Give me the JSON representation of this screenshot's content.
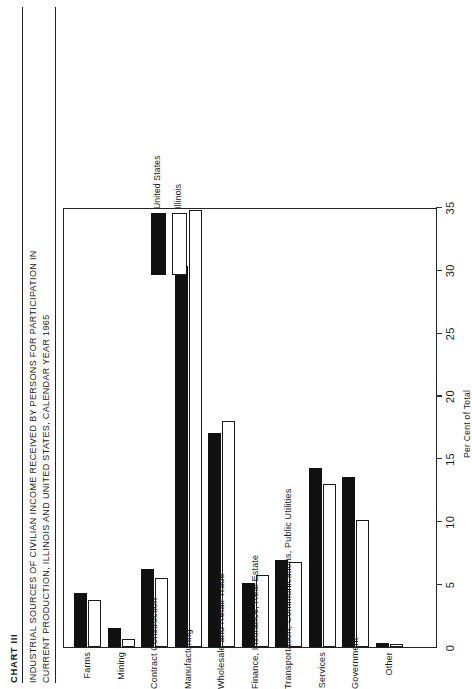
{
  "header": {
    "chart_number": "CHART III",
    "caption_line_1": "INDUSTRIAL SOURCES OF CIVILIAN INCOME RECEIVED BY PERSONS FOR PARTICIPATION IN",
    "caption_line_2": "CURRENT PRODUCTION, ILLINOIS AND UNITED STATES, CALENDAR YEAR 1965"
  },
  "legend": {
    "position": "upper-right-inside-plot",
    "entries": [
      {
        "label": "United States",
        "color": "#111111",
        "style": "solid-black"
      },
      {
        "label": "Illinois",
        "color": "#ffffff",
        "style": "open-outline"
      }
    ]
  },
  "chart_data": {
    "type": "bar",
    "orientation": "vertical-printed-sideways",
    "title": "INDUSTRIAL SOURCES OF CIVILIAN INCOME RECEIVED BY PERSONS FOR PARTICIPATION IN CURRENT PRODUCTION, ILLINOIS AND UNITED STATES, CALENDAR YEAR 1965",
    "xlabel": "",
    "ylabel": "Per Cent of Total",
    "ylim": [
      0,
      35
    ],
    "yticks": [
      0,
      5,
      10,
      15,
      20,
      25,
      30,
      35
    ],
    "ytick_labels": [
      "0",
      "5",
      "10",
      "15",
      "20",
      "25",
      "30",
      "35"
    ],
    "grid": false,
    "categories": [
      "Farms",
      "Mining",
      "Contract Construction",
      "Manufacturing",
      "Wholesale and Retail Trade",
      "Finance, Insurance, Real Estate",
      "Transportation, Communications, Public Utilities",
      "Services",
      "Government",
      "Other"
    ],
    "series": [
      {
        "name": "United States",
        "color": "#111111",
        "values": [
          4.3,
          1.5,
          6.2,
          30.3,
          17.0,
          5.1,
          6.9,
          14.2,
          13.5,
          0.3
        ]
      },
      {
        "name": "Illinois",
        "color": "#ffffff",
        "values": [
          3.7,
          0.6,
          5.5,
          34.8,
          18.0,
          5.7,
          6.8,
          13.0,
          10.1,
          0.2
        ]
      }
    ]
  }
}
